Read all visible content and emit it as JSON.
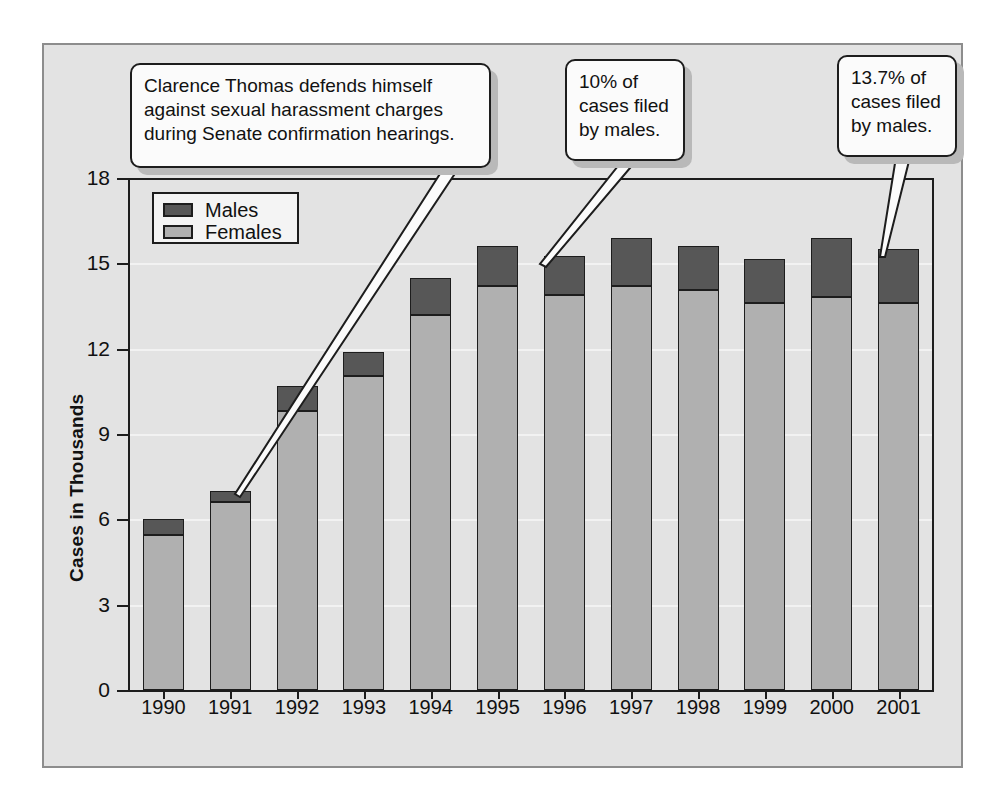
{
  "chart_data": {
    "type": "bar",
    "subtype": "stacked-bar",
    "title": "",
    "xlabel": "Year",
    "ylabel": "Cases in Thousands",
    "ylim": [
      0,
      18
    ],
    "ytick_values": [
      0,
      3,
      6,
      9,
      12,
      15,
      18
    ],
    "ytick_labels": [
      "0",
      "3",
      "6",
      "9",
      "12",
      "15",
      "18"
    ],
    "grid": true,
    "legend_position": "upper-left-inside",
    "categories": [
      "1990",
      "1991",
      "1992",
      "1993",
      "1994",
      "1995",
      "1996",
      "1997",
      "1998",
      "1999",
      "2000",
      "2001"
    ],
    "series": [
      {
        "name": "Females",
        "color": "#b0b0b0",
        "values": [
          5.45,
          6.6,
          9.8,
          11.05,
          13.2,
          14.2,
          13.9,
          14.2,
          14.05,
          13.6,
          13.8,
          13.6
        ]
      },
      {
        "name": "Males",
        "color": "#575757",
        "values": [
          0.55,
          0.4,
          0.9,
          0.85,
          1.3,
          1.4,
          1.35,
          1.7,
          1.55,
          1.55,
          2.1,
          1.9
        ]
      }
    ],
    "totals": [
      6.0,
      7.0,
      10.7,
      11.9,
      14.5,
      15.6,
      15.25,
      15.9,
      15.6,
      15.15,
      15.9,
      15.5
    ],
    "annotations": [
      {
        "id": "clarence-thomas",
        "text": "Clarence Thomas defends himself against sexual harassment charges during Senate confirmation hearings.",
        "target_category": "1991"
      },
      {
        "id": "males-1996",
        "text": "10% of cases filed by males.",
        "target_category": "1996"
      },
      {
        "id": "males-2001",
        "text": "13.7% of cases filed by males.",
        "target_category": "2001"
      }
    ]
  },
  "legend": {
    "items": [
      {
        "label": "Males",
        "color": "#575757"
      },
      {
        "label": "Females",
        "color": "#b0b0b0"
      }
    ]
  },
  "axes": {
    "y_title": "Cases in Thousands",
    "x_title": "Year"
  },
  "callouts": {
    "c1": {
      "lines": [
        "Clarence Thomas defends himself",
        "against sexual harassment charges",
        "during Senate confirmation hearings."
      ]
    },
    "c2": {
      "lines": [
        "10% of",
        "cases filed",
        "by males."
      ]
    },
    "c3": {
      "lines": [
        "13.7% of",
        "cases filed",
        "by males."
      ]
    }
  },
  "colors": {
    "plate_bg": "#e3e3e3",
    "plate_border": "#8d8d8d",
    "males": "#575757",
    "females": "#b0b0b0",
    "axis": "#1d1d1d",
    "gridline": "#f2f2f2",
    "callout_bg": "#fbfbfb",
    "callout_shadow": "#b9b9b9"
  }
}
